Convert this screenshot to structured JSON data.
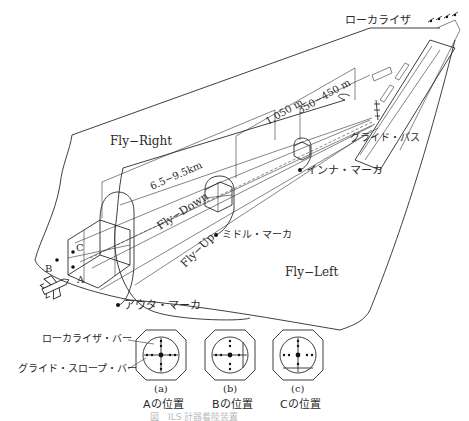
{
  "diagram": {
    "labels": {
      "localizer": "ローカライザ",
      "glide_path": "グライド・パス",
      "inner_marker": "インナ・マーカ",
      "middle_marker": "ミドル・マーカ",
      "outer_marker": "アウタ・マーカ",
      "fly_right": "Fly−Right",
      "fly_left": "Fly−Left",
      "fly_down": "Fly−Down",
      "fly_up": "Fly−Up",
      "dist_outer": "6.5−9.5km",
      "dist_middle": "1,050 m",
      "dist_inner": "350−450 m",
      "point_a": "A",
      "point_b": "B",
      "point_c": "C"
    },
    "indicators": {
      "localizer_bar_label": "ローカライザ・バー",
      "glide_slope_bar_label": "グライド・スロープ・バー",
      "items": [
        {
          "tag": "(a)",
          "caption": "Aの位置"
        },
        {
          "tag": "(b)",
          "caption": "Bの位置"
        },
        {
          "tag": "(c)",
          "caption": "Cの位置"
        }
      ]
    },
    "figure_caption": "図　ILS 計器着陸装置"
  }
}
